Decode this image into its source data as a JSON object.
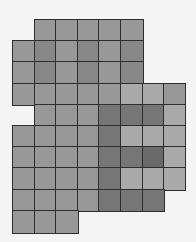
{
  "grid": {
    "origin": [
      13,
      20
    ],
    "col_edges": [
      13,
      35,
      56,
      78,
      99,
      121,
      143,
      164,
      185
    ],
    "row_edges": [
      20,
      41,
      62,
      84,
      105,
      126,
      147,
      168,
      190,
      211,
      233
    ],
    "colors": {
      "m": "#989898",
      "d": "#878787",
      "k": "#767676",
      "K": "#6a6a6a",
      "l": "#a9a9a9"
    },
    "rows": [
      ".mmmmm..",
      "mdmdmd..",
      "mdmdmd..",
      "mmmmmllm",
      ".mmmkkkl",
      "mmmmklll",
      "mmmmkkKl",
      "mmmmklll",
      "mmmmkkk.",
      "mmm....."
    ]
  }
}
